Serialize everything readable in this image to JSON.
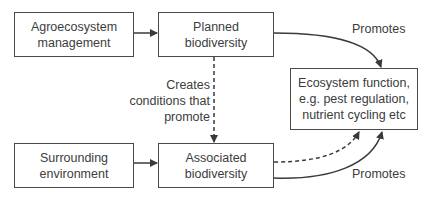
{
  "diagram": {
    "nodes": [
      {
        "id": "agro",
        "label": "Agroecosystem\nmanagement"
      },
      {
        "id": "planned",
        "label": "Planned\nbiodiversity"
      },
      {
        "id": "ecosystem",
        "label": "Ecosystem function,\ne.g. pest regulation,\nnutrient cycling etc"
      },
      {
        "id": "surrounding",
        "label": "Surrounding\nenvironment"
      },
      {
        "id": "associated",
        "label": "Associated\nbiodiversity"
      }
    ],
    "edges": [
      {
        "from": "agro",
        "to": "planned",
        "style": "solid",
        "label": ""
      },
      {
        "from": "planned",
        "to": "ecosystem",
        "style": "solid",
        "label": "Promotes"
      },
      {
        "from": "planned",
        "to": "associated",
        "style": "dashed",
        "label": "Creates\nconditions that\npromote"
      },
      {
        "from": "surrounding",
        "to": "associated",
        "style": "solid",
        "label": ""
      },
      {
        "from": "associated",
        "to": "ecosystem",
        "style": "dashed",
        "label": ""
      },
      {
        "from": "associated",
        "to": "ecosystem",
        "style": "solid",
        "label": "Promotes"
      }
    ],
    "labels": {
      "promotes_top": "Promotes",
      "creates": "Creates\nconditions that\npromote",
      "promotes_bottom": "Promotes"
    },
    "colors": {
      "line": "#3a3a3a",
      "text": "#3c3c3c",
      "background": "#ffffff"
    }
  }
}
